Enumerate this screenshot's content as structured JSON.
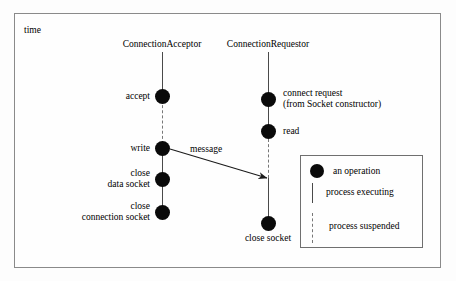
{
  "diagram": {
    "axis_label": "time",
    "lifelines": [
      {
        "id": "acceptor",
        "title": "ConnectionAcceptor",
        "operations": [
          {
            "label": "accept",
            "label_lines": [
              "accept"
            ]
          },
          {
            "label": "write",
            "label_lines": [
              "write"
            ]
          },
          {
            "label": "close data socket",
            "label_lines": [
              "close",
              "data socket"
            ]
          },
          {
            "label": "close connection socket",
            "label_lines": [
              "close",
              "connection socket"
            ]
          }
        ]
      },
      {
        "id": "requestor",
        "title": "ConnectionRequestor",
        "operations": [
          {
            "label": "connect request (from Socket constructor)",
            "label_lines": [
              "connect request",
              "(from Socket constructor)"
            ]
          },
          {
            "label": "read",
            "label_lines": [
              "read"
            ]
          },
          {
            "label": "close socket",
            "label_lines": [
              "close socket"
            ]
          }
        ]
      }
    ],
    "messages": [
      {
        "label": "message",
        "from": "acceptor",
        "to": "requestor"
      }
    ],
    "legend": {
      "items": [
        {
          "symbol": "operation-dot",
          "label": "an operation"
        },
        {
          "symbol": "solid-line",
          "label": "process executing"
        },
        {
          "symbol": "dashed-line",
          "label": "process suspended"
        }
      ]
    },
    "colors": {
      "node_fill": "#0a0a0a",
      "line_executing": "#4a4a4a",
      "line_suspended": "#777777",
      "frame_border": "#8a8a8a",
      "background": "#fdfdfd"
    }
  }
}
